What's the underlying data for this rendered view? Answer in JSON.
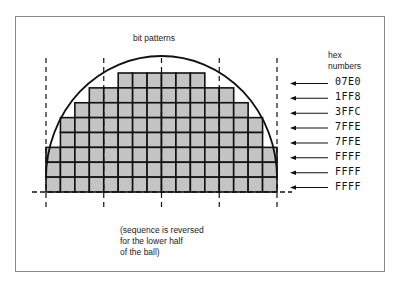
{
  "title": "bit patterns",
  "hex_header": [
    "hex",
    "numbers"
  ],
  "caption": [
    "(sequence is reversed",
    "for the lower half",
    "of the ball)"
  ],
  "rows": [
    {
      "hex": "07E0",
      "start_col": 5,
      "end_col": 10
    },
    {
      "hex": "1FF8",
      "start_col": 3,
      "end_col": 12
    },
    {
      "hex": "3FFC",
      "start_col": 2,
      "end_col": 13
    },
    {
      "hex": "7FFE",
      "start_col": 1,
      "end_col": 14
    },
    {
      "hex": "7FFE",
      "start_col": 1,
      "end_col": 14
    },
    {
      "hex": "FFFF",
      "start_col": 0,
      "end_col": 15
    },
    {
      "hex": "FFFF",
      "start_col": 0,
      "end_col": 15
    },
    {
      "hex": "FFFF",
      "start_col": 0,
      "end_col": 15
    }
  ],
  "grid": {
    "columns": 16,
    "rows": 8
  },
  "colors": {
    "fill": "#c4c4c4",
    "line": "#111111",
    "frame": "#8a8a8a"
  }
}
